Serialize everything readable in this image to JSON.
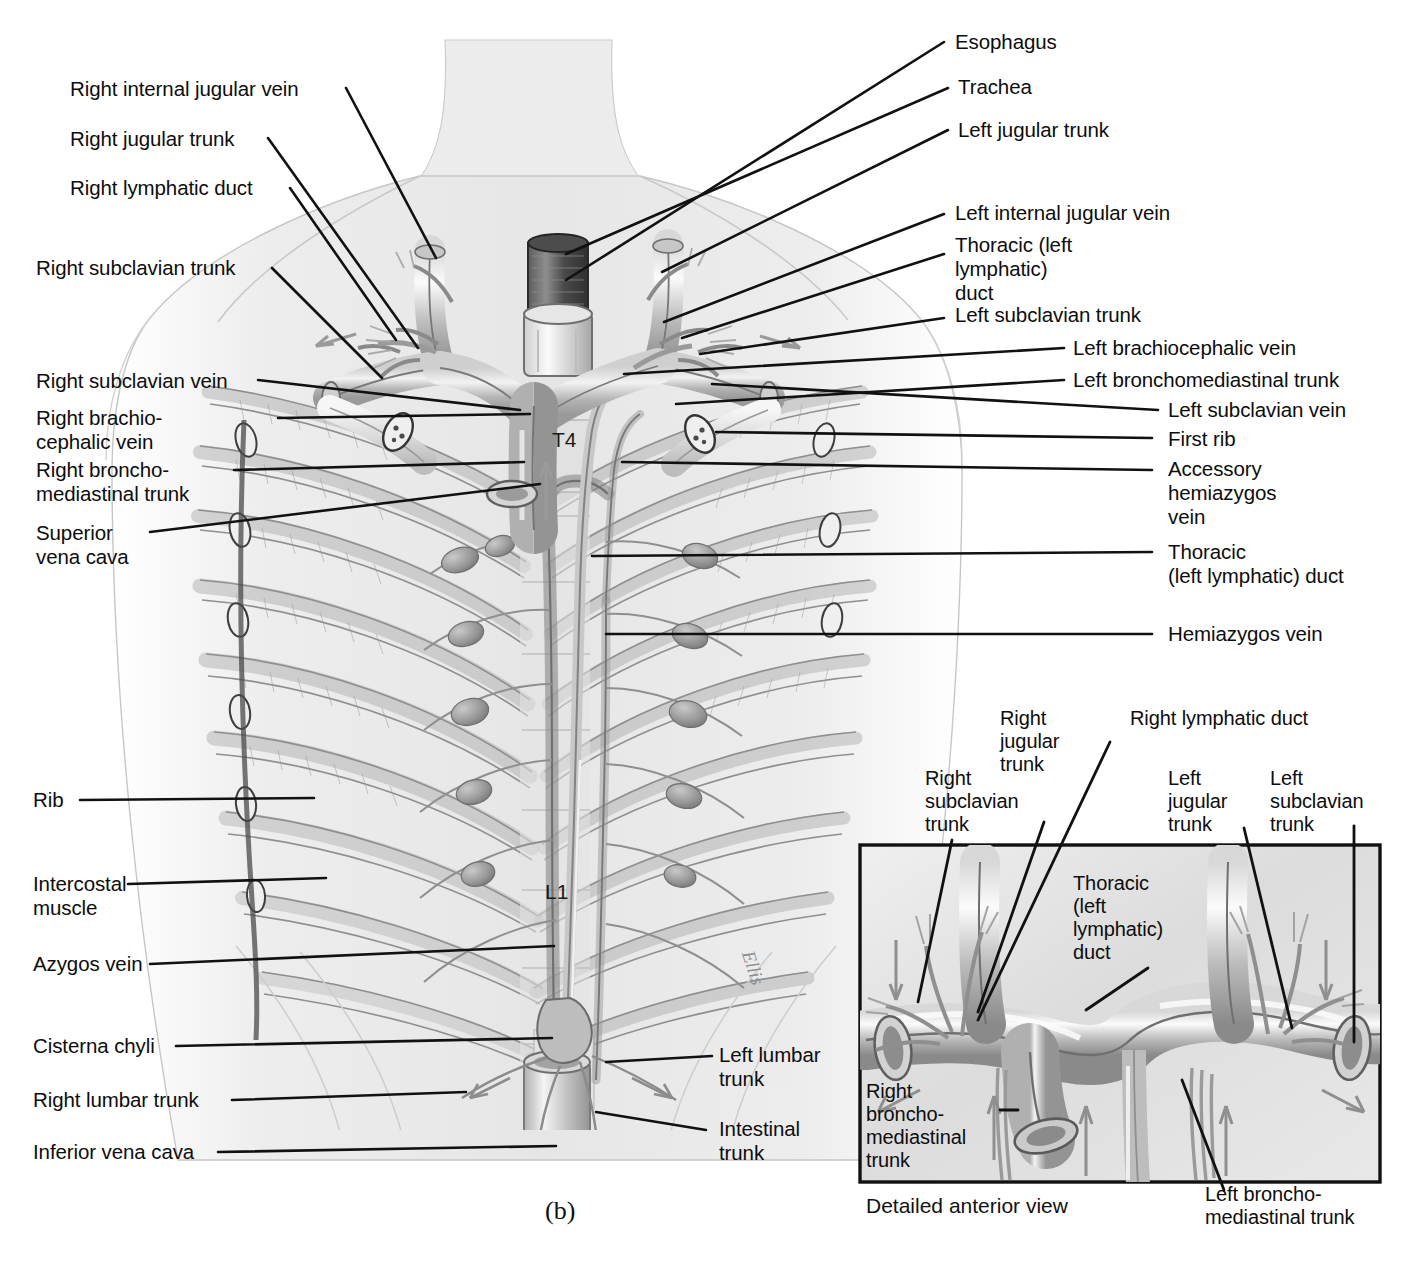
{
  "figure": {
    "panel_caption": "(b)",
    "artist_signature": "Ellis",
    "vertebra_labels": [
      {
        "id": "t4",
        "text": "T4"
      },
      {
        "id": "l1",
        "text": "L1"
      }
    ]
  },
  "labels_left": [
    {
      "id": "right-internal-jugular-vein",
      "text": "Right internal jugular vein"
    },
    {
      "id": "right-jugular-trunk",
      "text": "Right jugular trunk"
    },
    {
      "id": "right-lymphatic-duct",
      "text": "Right lymphatic duct"
    },
    {
      "id": "right-subclavian-trunk",
      "text": "Right subclavian trunk"
    },
    {
      "id": "right-subclavian-vein",
      "text": "Right subclavian vein"
    },
    {
      "id": "right-brachiocephalic-vein",
      "text": "Right brachio-\ncephalic vein"
    },
    {
      "id": "right-bronchomediastinal-trunk",
      "text": "Right broncho-\nmediastinal trunk"
    },
    {
      "id": "superior-vena-cava",
      "text": "Superior\nvena cava"
    },
    {
      "id": "rib",
      "text": "Rib"
    },
    {
      "id": "intercostal-muscle",
      "text": "Intercostal\nmuscle"
    },
    {
      "id": "azygos-vein",
      "text": "Azygos vein"
    },
    {
      "id": "cisterna-chyli",
      "text": "Cisterna chyli"
    },
    {
      "id": "right-lumbar-trunk",
      "text": "Right lumbar trunk"
    },
    {
      "id": "inferior-vena-cava",
      "text": "Inferior vena cava"
    }
  ],
  "labels_right": [
    {
      "id": "esophagus",
      "text": "Esophagus"
    },
    {
      "id": "trachea",
      "text": "Trachea"
    },
    {
      "id": "left-jugular-trunk",
      "text": "Left jugular trunk"
    },
    {
      "id": "left-internal-jugular-vein",
      "text": "Left internal jugular vein"
    },
    {
      "id": "thoracic-left-lymphatic-duct-upper",
      "text": "Thoracic (left\nlymphatic)\nduct"
    },
    {
      "id": "left-subclavian-trunk",
      "text": "Left subclavian trunk"
    },
    {
      "id": "left-brachiocephalic-vein",
      "text": "Left brachiocephalic vein"
    },
    {
      "id": "left-bronchomediastinal-trunk",
      "text": "Left bronchomediastinal trunk"
    },
    {
      "id": "left-subclavian-vein",
      "text": "Left subclavian vein"
    },
    {
      "id": "first-rib",
      "text": "First rib"
    },
    {
      "id": "accessory-hemiazygos-vein",
      "text": "Accessory\nhemiazygos\nvein"
    },
    {
      "id": "thoracic-left-lymphatic-duct-lower",
      "text": "Thoracic\n(left lymphatic) duct"
    },
    {
      "id": "hemiazygos-vein",
      "text": "Hemiazygos vein"
    },
    {
      "id": "left-lumbar-trunk",
      "text": "Left lumbar\ntrunk"
    },
    {
      "id": "intestinal-trunk",
      "text": "Intestinal\ntrunk"
    }
  ],
  "inset": {
    "caption": "Detailed anterior view",
    "labels": [
      {
        "id": "inset-right-subclavian-trunk",
        "text": "Right\nsubclavian\ntrunk"
      },
      {
        "id": "inset-right-jugular-trunk",
        "text": "Right\njugular\ntrunk"
      },
      {
        "id": "inset-right-lymphatic-duct",
        "text": "Right lymphatic duct"
      },
      {
        "id": "inset-left-jugular-trunk",
        "text": "Left\njugular\ntrunk"
      },
      {
        "id": "inset-left-subclavian-trunk",
        "text": "Left\nsubclavian\ntrunk"
      },
      {
        "id": "inset-thoracic-left-lymphatic-duct",
        "text": "Thoracic\n(left\nlymphatic)\nduct"
      },
      {
        "id": "inset-right-bronchomediastinal-trunk",
        "text": "Right\nbroncho-\nmediastinal\ntrunk"
      },
      {
        "id": "inset-left-bronchomediastinal-trunk",
        "text": "Left broncho-\nmediastinal trunk"
      }
    ]
  },
  "colors": {
    "ink": "#0d0d0d",
    "leader": "#111111",
    "body_tint": "#e9e9e9",
    "vessel_mid": "#b9b9b9",
    "vessel_dark": "#8d8d8d",
    "rib_tone": "#cfcfcf",
    "node_tone": "#a0a0a0",
    "inset_bg": "#e2e2e2"
  }
}
